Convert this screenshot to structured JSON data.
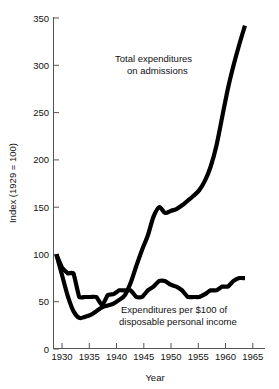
{
  "chart_data": {
    "type": "line",
    "title": "",
    "xlabel": "Year",
    "ylabel": "Index (1929 = 100)",
    "xlim": [
      1928.5,
      1965.5
    ],
    "ylim": [
      0,
      350
    ],
    "xticks": [
      1930,
      1935,
      1940,
      1945,
      1950,
      1955,
      1960,
      1965
    ],
    "xtick_labels": [
      "1930",
      "1935",
      "1940",
      "1945",
      "1950",
      "1955",
      "1960",
      "1965"
    ],
    "yticks": [
      0,
      50,
      100,
      150,
      200,
      250,
      300,
      350
    ],
    "ytick_labels": [
      "0",
      "50",
      "100",
      "150",
      "200",
      "250",
      "300",
      "350"
    ],
    "grid": false,
    "legend_position": "inline-annotations",
    "line_color": "#000000",
    "series": [
      {
        "name": "Total expenditures on admissions",
        "annotation": "Total expenditures\non admissions",
        "annotation_line1": "Total expenditures",
        "annotation_line2": "on admissions",
        "x": [
          1929,
          1930,
          1931,
          1932,
          1933,
          1934,
          1935,
          1936,
          1937,
          1938,
          1939,
          1940,
          1941,
          1942,
          1943,
          1944,
          1945,
          1946,
          1947,
          1948,
          1949,
          1950,
          1951,
          1952,
          1953,
          1954,
          1955,
          1956,
          1957,
          1958,
          1959,
          1960,
          1961,
          1962
        ],
        "values": [
          100,
          78,
          56,
          40,
          33,
          34,
          36,
          40,
          44,
          46,
          48,
          52,
          57,
          70,
          88,
          105,
          120,
          140,
          150,
          144,
          146,
          148,
          152,
          157,
          162,
          168,
          178,
          193,
          215,
          245,
          275,
          300,
          322,
          342
        ]
      },
      {
        "name": "Expenditures per $100 of disposable personal income",
        "annotation": "Expenditures per $100 of\ndisposable personal income",
        "annotation_line1": "Expenditures per $100 of",
        "annotation_line2": "disposable personal income",
        "x": [
          1929,
          1930,
          1931,
          1932,
          1933,
          1934,
          1935,
          1936,
          1937,
          1938,
          1939,
          1940,
          1941,
          1942,
          1943,
          1944,
          1945,
          1946,
          1947,
          1948,
          1949,
          1950,
          1951,
          1952,
          1953,
          1954,
          1955,
          1956,
          1957,
          1958,
          1959,
          1960,
          1961,
          1962
        ],
        "values": [
          100,
          86,
          80,
          80,
          55,
          55,
          55,
          55,
          46,
          57,
          58,
          62,
          62,
          62,
          55,
          55,
          62,
          66,
          72,
          72,
          68,
          66,
          62,
          55,
          55,
          55,
          58,
          62,
          62,
          66,
          66,
          72,
          75,
          75
        ]
      }
    ]
  }
}
